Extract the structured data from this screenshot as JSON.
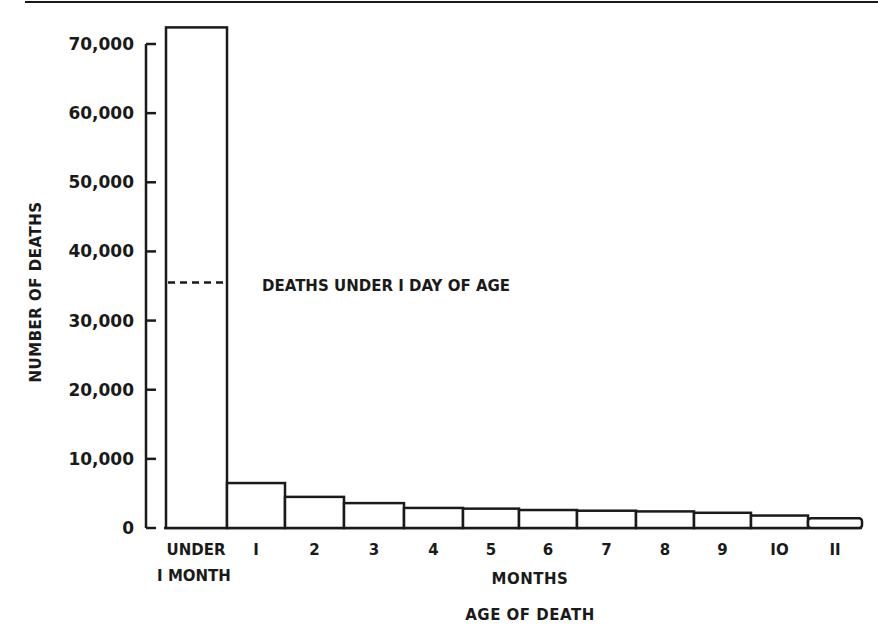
{
  "chart_data": {
    "type": "bar",
    "title": "",
    "xlabel": "AGE OF DEATH",
    "xlabel_sub": "MONTHS",
    "ylabel": "NUMBER OF DEATHS",
    "ylim": [
      0,
      70000
    ],
    "yticks": [
      0,
      10000,
      20000,
      30000,
      40000,
      50000,
      60000,
      70000
    ],
    "ytick_labels": [
      "0",
      "10,000",
      "20,000",
      "30,000",
      "40,000",
      "50,000",
      "60,000",
      "70,000"
    ],
    "categories": [
      "UNDER 1 MONTH",
      "1",
      "2",
      "3",
      "4",
      "5",
      "6",
      "7",
      "8",
      "9",
      "10",
      "11"
    ],
    "category_labels": [
      [
        "UNDER",
        "I MONTH"
      ],
      [
        "I"
      ],
      [
        "2"
      ],
      [
        "3"
      ],
      [
        "4"
      ],
      [
        "5"
      ],
      [
        "6"
      ],
      [
        "7"
      ],
      [
        "8"
      ],
      [
        "9"
      ],
      [
        "IO"
      ],
      [
        "II"
      ]
    ],
    "values": [
      72400,
      6500,
      4500,
      3600,
      2900,
      2800,
      2600,
      2500,
      2400,
      2200,
      1800,
      1400
    ],
    "annotations": [
      {
        "text": "DEATHS UNDER I DAY OF AGE",
        "value": 35500,
        "style": "dashed line within first bar"
      }
    ],
    "grid": false,
    "legend": "none",
    "bar_fill": "#ffffff",
    "bar_stroke": "#1a1a1a"
  }
}
